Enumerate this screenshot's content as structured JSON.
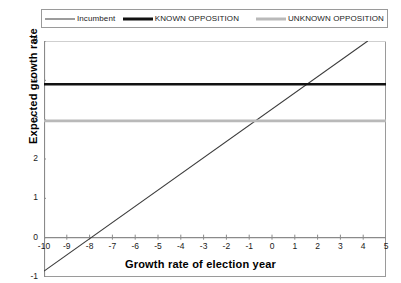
{
  "chart_data": {
    "type": "line",
    "title": "",
    "xlabel": "Growth rate of election year",
    "ylabel": "Expected growth rate",
    "xlim": [
      -10,
      5
    ],
    "ylim": [
      -1,
      5
    ],
    "xticks": [
      -10,
      -9,
      -8,
      -7,
      -6,
      -5,
      -4,
      -3,
      -2,
      -1,
      0,
      1,
      2,
      3,
      4,
      5
    ],
    "yticks": [
      -1,
      0,
      1,
      2,
      3,
      4,
      5
    ],
    "grid": false,
    "legend_position": "top",
    "series": [
      {
        "name": "Incumbent",
        "style": "thin-line",
        "color": "#3b3b3b",
        "x": [
          -10,
          4.2
        ],
        "values": [
          -0.85,
          5.0
        ],
        "slope": 0.412,
        "intercept": 3.27
      },
      {
        "name": "KNOWN OPPOSITION",
        "style": "thick-line",
        "color": "#111111",
        "x": [
          -10,
          5
        ],
        "values": [
          3.9,
          3.9
        ]
      },
      {
        "name": "UNKNOWN OPPOSITION",
        "style": "thick-line",
        "color": "#b9b9b9",
        "x": [
          -10,
          5
        ],
        "values": [
          2.97,
          2.97
        ]
      }
    ]
  },
  "legend": {
    "items": [
      {
        "label": "Incumbent"
      },
      {
        "label": "KNOWN OPPOSITION"
      },
      {
        "label": "UNKNOWN OPPOSITION"
      }
    ]
  },
  "axes": {
    "y_title": "Expected growth rate",
    "x_title": "Growth rate of election year",
    "y_tick_labels": [
      "5",
      "4",
      "3",
      "2",
      "1",
      "0",
      "-1"
    ],
    "x_tick_labels": [
      "-10",
      "-9",
      "-8",
      "-7",
      "-6",
      "-5",
      "-4",
      "-3",
      "-2",
      "-1",
      "0",
      "1",
      "2",
      "3",
      "4",
      "5"
    ]
  }
}
